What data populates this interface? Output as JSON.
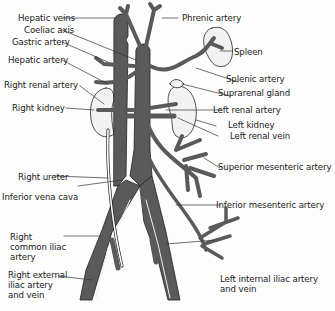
{
  "diagram": {
    "type": "anatomical-illustration",
    "colors": {
      "vessel_fill": "#5a5a5a",
      "vessel_outline": "#222222",
      "organ_fill": "#f2f2f2",
      "leader_line": "#333333",
      "background": "#fdfdfd"
    },
    "labels_left": [
      {
        "id": "hepatic-veins",
        "text": "Hepatic veins"
      },
      {
        "id": "coeliac-axis",
        "text": "Coeliac axis"
      },
      {
        "id": "gastric-artery",
        "text": "Gastric artery"
      },
      {
        "id": "hepatic-artery",
        "text": "Hepatic artery"
      },
      {
        "id": "right-renal-artery",
        "text": "Right renal artery"
      },
      {
        "id": "right-kidney",
        "text": "Right kidney"
      },
      {
        "id": "right-ureter",
        "text": "Right ureter"
      },
      {
        "id": "inferior-vena-cava",
        "text": "Inferior vena cava"
      },
      {
        "id": "right-common-iliac-artery",
        "text": "Right common iliac artery"
      },
      {
        "id": "right-external-iliac",
        "text": "Right external iliac artery and vein"
      }
    ],
    "labels_right": [
      {
        "id": "phrenic-artery",
        "text": "Phrenic artery"
      },
      {
        "id": "spleen",
        "text": "Spleen"
      },
      {
        "id": "splenic-artery",
        "text": "Splenic artery"
      },
      {
        "id": "suprarenal-gland",
        "text": "Suprarenal gland"
      },
      {
        "id": "left-renal-artery",
        "text": "Left renal artery"
      },
      {
        "id": "left-kidney",
        "text": "Left kidney"
      },
      {
        "id": "left-renal-vein",
        "text": "Left renal vein"
      },
      {
        "id": "superior-mesenteric-artery",
        "text": "Superior mesenteric artery"
      },
      {
        "id": "inferior-mesenteric-artery",
        "text": "Inferior mesenteric artery"
      },
      {
        "id": "left-internal-iliac",
        "text": "Left internal iliac artery and vein"
      }
    ]
  }
}
